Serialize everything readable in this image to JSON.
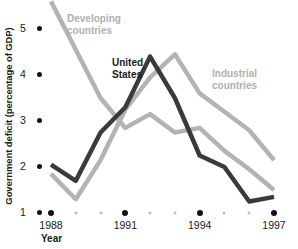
{
  "chart_data": {
    "type": "line",
    "title": "",
    "xlabel": "Year",
    "ylabel": "Government deficit (percentage of GDP)",
    "xlim": [
      1988,
      1997
    ],
    "ylim": [
      1,
      5.5
    ],
    "grid": false,
    "legend_position": "inline-annotations",
    "x": [
      1988,
      1989,
      1990,
      1991,
      1992,
      1993,
      1994,
      1995,
      1996,
      1997
    ],
    "x_tick_labels": [
      "1988",
      "1991",
      "1994",
      "1997"
    ],
    "x_tick_values": [
      1988,
      1991,
      1994,
      1997
    ],
    "y_tick_labels": [
      "1",
      "2",
      "3",
      "4",
      "5"
    ],
    "y_tick_values": [
      1,
      2,
      3,
      4,
      5
    ],
    "series": [
      {
        "name": "Developing countries",
        "color": "#b3b3b3",
        "values": [
          5.6,
          4.55,
          3.5,
          2.85,
          3.15,
          2.75,
          2.85,
          2.35,
          1.95,
          1.5
        ]
      },
      {
        "name": "United States",
        "color": "#3a3a3a",
        "values": [
          2.05,
          1.7,
          2.75,
          3.3,
          4.4,
          3.5,
          2.25,
          2.0,
          1.25,
          1.35
        ]
      },
      {
        "name": "Industrial countries",
        "color": "#b3b3b3",
        "values": [
          1.85,
          1.3,
          2.15,
          3.25,
          3.95,
          4.45,
          3.6,
          3.2,
          2.8,
          2.15
        ]
      }
    ]
  },
  "annotations": {
    "developing": "Developing\ncountries",
    "united_states": "United\nStates",
    "industrial": "Industrial\ncountries"
  },
  "axes": {
    "y_title": "Government deficit (percentage of GDP)",
    "x_title": "Year",
    "y_ticks": [
      "5",
      "4",
      "3",
      "2",
      "1"
    ],
    "x_ticks": [
      "1988",
      "1991",
      "1994",
      "1997"
    ]
  },
  "colors": {
    "dark_series": "#3a3a3a",
    "light_series": "#b3b3b3",
    "axis_text": "#1a1a1a",
    "minor_dot": "#bdbdbd",
    "background": "#ffffff"
  }
}
